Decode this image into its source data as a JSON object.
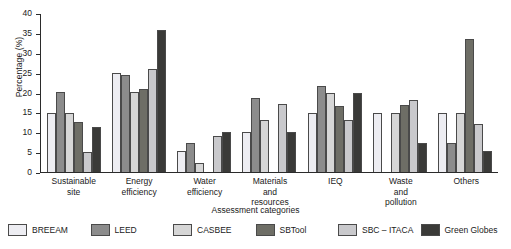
{
  "chart_data": {
    "type": "bar",
    "title": "",
    "xlabel": "Assessment categories",
    "ylabel": "Percentage (%)",
    "ylim": [
      0,
      40
    ],
    "ytick_labels": [
      "0",
      "5",
      "10",
      "15",
      "20",
      "25",
      "30",
      "35",
      "40"
    ],
    "ytick_values": [
      0,
      5,
      10,
      15,
      20,
      25,
      30,
      35,
      40
    ],
    "grid": false,
    "legend_position": "bottom",
    "categories": [
      "Sustainable\nsite",
      "Energy\nefficiency",
      "Water\nefficiency",
      "Materials\nand\nresources",
      "IEQ",
      "Waste\nand\npollution",
      "Others"
    ],
    "series": [
      {
        "name": "BREEAM",
        "color": "#ededf2",
        "values": [
          14.9,
          25.0,
          5.3,
          10.1,
          14.9,
          14.9,
          14.9
        ]
      },
      {
        "name": "LEED",
        "color": "#8c8c8c",
        "values": [
          20.2,
          24.5,
          7.4,
          18.5,
          21.6,
          0,
          7.4
        ]
      },
      {
        "name": "CASBEE",
        "color": "#d6d6d6",
        "values": [
          14.9,
          20.1,
          2.2,
          13.0,
          19.9,
          14.9,
          14.9
        ]
      },
      {
        "name": "SBTool",
        "color": "#6e6e66",
        "values": [
          12.6,
          20.9,
          0,
          0,
          16.7,
          16.8,
          33.5
        ]
      },
      {
        "name": "SBC – ITACA",
        "color": "#c9c9cc",
        "values": [
          5.1,
          25.9,
          9.1,
          17.1,
          13.0,
          18.0,
          12.1
        ]
      },
      {
        "name": "Green Globes",
        "color": "#3a3a38",
        "values": [
          11.4,
          35.7,
          10.1,
          10.1,
          19.9,
          7.4,
          5.2
        ]
      }
    ]
  }
}
